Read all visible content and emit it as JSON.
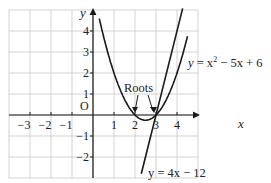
{
  "chart_data": {
    "type": "line",
    "title": "",
    "xlabel": "x",
    "ylabel": "y",
    "origin_label": "O",
    "xlim": [
      -4,
      5
    ],
    "ylim": [
      -3,
      5
    ],
    "grid": true,
    "x_ticks": [
      "−3",
      "−2",
      "−1",
      "1",
      "2",
      "3",
      "4"
    ],
    "y_ticks": [
      "4",
      "3",
      "2",
      "1",
      "−1",
      "−2"
    ],
    "series": [
      {
        "name": "y = x² − 5x + 6",
        "type": "parabola",
        "equation": "y = x^2 - 5x + 6",
        "x": [
          -0.2,
          0,
          0.5,
          1,
          1.5,
          2,
          2.5,
          3,
          3.5,
          4,
          4.4
        ],
        "y": [
          7.04,
          6,
          3.75,
          2,
          0.75,
          0,
          -0.25,
          0,
          0.75,
          2,
          4.36
        ]
      },
      {
        "name": "y = 4x − 12",
        "type": "line",
        "equation": "y = 4x - 12",
        "x": [
          2.3,
          3,
          4.25
        ],
        "y": [
          -2.8,
          0,
          5
        ]
      }
    ],
    "annotations": [
      {
        "text": "Roots",
        "points_to": [
          [
            2,
            0
          ],
          [
            3,
            0
          ]
        ]
      }
    ],
    "labels": {
      "parabola": "y = x² − 5x + 6",
      "line": "y = 4x − 12"
    }
  },
  "text": {
    "x_axis_label": "x",
    "y_axis_label": "y",
    "origin": "O",
    "roots": "Roots",
    "parabola_eq_y": "y",
    "parabola_eq_rest": " = x",
    "parabola_eq_sup": "2",
    "parabola_eq_tail": " − 5x + 6",
    "line_eq": "y = 4x − 12"
  }
}
